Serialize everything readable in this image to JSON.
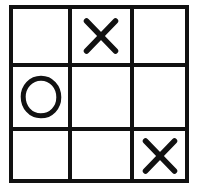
{
  "board": {
    "title": "Tic-Tac-Toe Board",
    "rows": 3,
    "columns": 3,
    "line_color": "#111111",
    "background_color": "#ffffff",
    "mark_x_label": "X",
    "mark_o_label": "O",
    "empty_label": "",
    "cells": [
      {
        "row": 0,
        "col": 0,
        "position": "top-left",
        "mark": "",
        "name": "cell-top-left"
      },
      {
        "row": 0,
        "col": 1,
        "position": "top-center",
        "mark": "X",
        "name": "cell-top-center"
      },
      {
        "row": 0,
        "col": 2,
        "position": "top-right",
        "mark": "",
        "name": "cell-top-right"
      },
      {
        "row": 1,
        "col": 0,
        "position": "middle-left",
        "mark": "O",
        "name": "cell-middle-left"
      },
      {
        "row": 1,
        "col": 1,
        "position": "middle-center",
        "mark": "",
        "name": "cell-middle-center"
      },
      {
        "row": 1,
        "col": 2,
        "position": "middle-right",
        "mark": "",
        "name": "cell-middle-right"
      },
      {
        "row": 2,
        "col": 0,
        "position": "bottom-left",
        "mark": "",
        "name": "cell-bottom-left"
      },
      {
        "row": 2,
        "col": 1,
        "position": "bottom-center",
        "mark": "",
        "name": "cell-bottom-center"
      },
      {
        "row": 2,
        "col": 2,
        "position": "bottom-right",
        "mark": "X",
        "name": "cell-bottom-right"
      }
    ]
  }
}
